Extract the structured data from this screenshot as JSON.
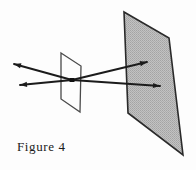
{
  "figure": {
    "caption": "Figure 4",
    "title": "Figure 4",
    "background_color": "#fdfdfd",
    "ink_color": "#1b1b1b",
    "shaded_plane": {
      "name": "image-plane",
      "fill_color": "#b9b9b9",
      "stroke_color": "#2a2a2a",
      "points": "124,12 169,38 183,155 128,113"
    },
    "pinhole_plane": {
      "name": "pinhole-plane",
      "fill_color": "none",
      "stroke_color": "#4a4a4a",
      "points": "61,53 81,66 80,112 61,99"
    },
    "pinhole_point": {
      "name": "pinhole",
      "x": 72,
      "y": 80,
      "color": "#111111"
    },
    "rays": [
      {
        "name": "ray-upper",
        "from_x": 14,
        "from_y": 64,
        "to_x": 147,
        "to_y": 62,
        "tail_arrow": true,
        "head_arrow": true
      },
      {
        "name": "ray-lower",
        "from_x": 20,
        "from_y": 85,
        "to_x": 160,
        "to_y": 86,
        "tail_arrow": true,
        "head_arrow": true
      }
    ]
  }
}
